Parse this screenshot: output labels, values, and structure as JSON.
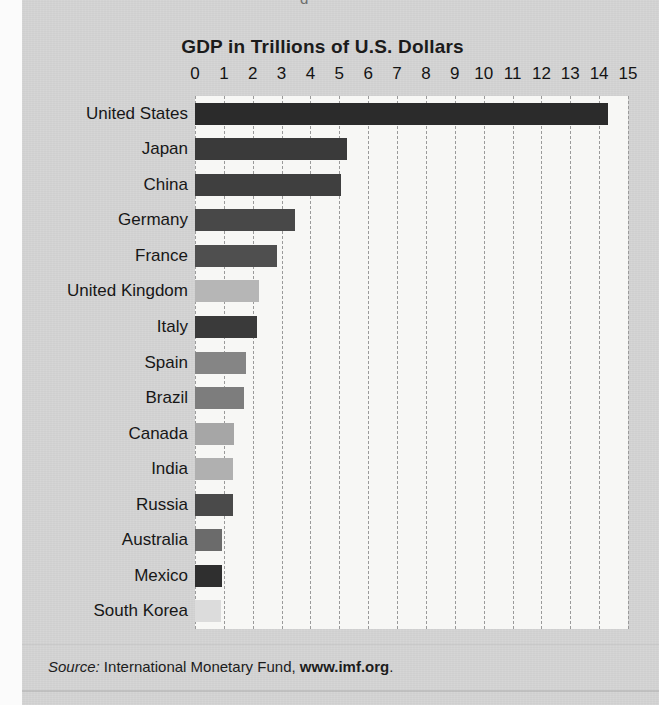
{
  "figure": {
    "title": "GDP in Trillions of U.S. Dollars",
    "source_prefix": "Source:",
    "source_body": " International Monetary Fund, ",
    "source_url": "www.imf.org",
    "source_suffix": ".",
    "ghost_top_fragment": "g"
  },
  "colors": {
    "paper": "#cfcfcf",
    "plot_bg": "#f7f7f5",
    "gridline": "#9a9a9a",
    "text": "#171717",
    "bar_darkest": "#2b2b2b",
    "bar_dark": "#3c3c3c",
    "bar_mid": "#6f6f6f",
    "bar_light": "#9e9e9e",
    "bar_lightest": "#cdcdcd"
  },
  "chart_data": {
    "type": "bar",
    "orientation": "horizontal",
    "title": "GDP in Trillions of U.S. Dollars",
    "xlabel": "",
    "ylabel": "",
    "xlim": [
      0,
      15
    ],
    "xticks": [
      0,
      1,
      2,
      3,
      4,
      5,
      6,
      7,
      8,
      9,
      10,
      11,
      12,
      13,
      14,
      15
    ],
    "xtick_labels": [
      "0",
      "1",
      "2",
      "3",
      "4",
      "5",
      "6",
      "7",
      "8",
      "9",
      "10",
      "11",
      "12",
      "13",
      "14",
      "15"
    ],
    "grid": true,
    "grid_axis": "x",
    "grid_style": "dashed",
    "legend": false,
    "units": "trillions of U.S. dollars",
    "categories": [
      "United States",
      "Japan",
      "China",
      "Germany",
      "France",
      "United Kingdom",
      "Italy",
      "Spain",
      "Brazil",
      "Canada",
      "India",
      "Russia",
      "Australia",
      "Mexico",
      "South Korea"
    ],
    "values": [
      14.3,
      5.25,
      5.05,
      3.45,
      2.85,
      2.2,
      2.15,
      1.75,
      1.7,
      1.35,
      1.3,
      1.3,
      0.95,
      0.95,
      0.9
    ],
    "bar_colors": [
      "#2b2b2b",
      "#3a3a3a",
      "#3f3f3f",
      "#484848",
      "#4f4f4f",
      "#b6b6b6",
      "#3a3a3a",
      "#858585",
      "#7d7d7d",
      "#a6a6a6",
      "#b0b0b0",
      "#4a4a4a",
      "#6b6b6b",
      "#2f2f2f",
      "#dcdcdc"
    ]
  }
}
